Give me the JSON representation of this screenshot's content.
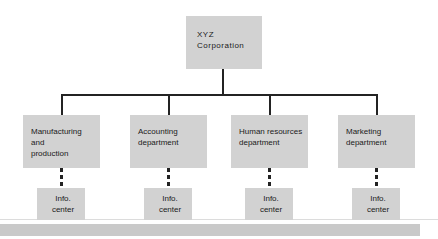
{
  "diagram": {
    "type": "organization-chart",
    "colors": {
      "box_fill": "#d2d2d2",
      "box_text": "#1a1a1a",
      "connector": "#232323",
      "background": "#ffffff",
      "footer_bar": "#c9c9c9",
      "rule": "#dcdcdc"
    },
    "root": {
      "label": "XYZ\nCorporation"
    },
    "departments": [
      {
        "label": "Manufacturing\nand\nproduction",
        "align": "left",
        "child": {
          "label": "Info.\ncenter"
        }
      },
      {
        "label": "Accounting\ndepartment",
        "align": "left",
        "child": {
          "label": "Info.\ncenter"
        }
      },
      {
        "label": "Human resources\ndepartment",
        "align": "left",
        "child": {
          "label": "Info.\ncenter"
        }
      },
      {
        "label": "Marketing\ndepartment",
        "align": "left",
        "child": {
          "label": "Info.\ncenter"
        }
      }
    ],
    "connector_styles": {
      "root_to_departments": "solid",
      "department_to_info_center": "dashed"
    }
  }
}
